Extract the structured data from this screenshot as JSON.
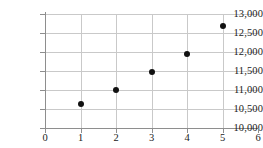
{
  "chart_data": {
    "type": "scatter",
    "title": "",
    "xlabel": "",
    "ylabel": "",
    "x": [
      1,
      2,
      3,
      4,
      5
    ],
    "values": [
      10620,
      11000,
      11470,
      11950,
      12680
    ],
    "points": [
      {
        "x": 1,
        "y": 10620
      },
      {
        "x": 2,
        "y": 11000
      },
      {
        "x": 3,
        "y": 11470
      },
      {
        "x": 4,
        "y": 11950
      },
      {
        "x": 5,
        "y": 12680
      }
    ],
    "xlim": [
      0,
      6
    ],
    "ylim": [
      10000,
      13000
    ],
    "xticks": [
      0,
      1,
      2,
      3,
      4,
      5,
      6
    ],
    "yticks": [
      10000,
      10500,
      11000,
      11500,
      12000,
      12500,
      13000
    ],
    "xtick_labels": [
      "0",
      "1",
      "2",
      "3",
      "4",
      "5",
      "6"
    ],
    "ytick_labels": [
      "10,000",
      "10,500",
      "11,000",
      "11,500",
      "12,000",
      "12,500",
      "13,000"
    ],
    "grid": true,
    "grid_axes": "both",
    "legend": null,
    "marker": "filled-circle",
    "marker_color": "#111111",
    "grid_color": "#c9c9c9",
    "axis_color": "#8e8e8e",
    "background_color": "#ffffff"
  }
}
